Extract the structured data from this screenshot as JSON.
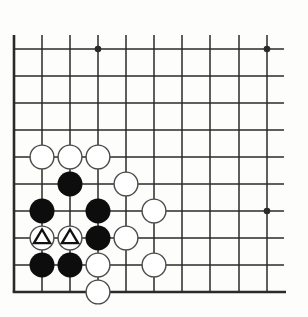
{
  "diagram": {
    "colors": {
      "background": "#fdfdfb",
      "line": "#2a2a2a",
      "black_stone": "#0d0d0d",
      "white_stone_fill": "#ffffff",
      "white_stone_stroke": "#4a4a4a"
    },
    "grid": {
      "columns": 10,
      "rows": 10,
      "x_positions": [
        14,
        42,
        70,
        98,
        126,
        154,
        182,
        210,
        239,
        267
      ],
      "y_positions": [
        49,
        76,
        103,
        130,
        157,
        184,
        211,
        238,
        265,
        292
      ],
      "top_extent": 35,
      "right_extent": 284,
      "edges": [
        "left",
        "bottom"
      ]
    },
    "star_points": [
      {
        "col": 3,
        "row": 0
      },
      {
        "col": 9,
        "row": 0
      },
      {
        "col": 9,
        "row": 6
      }
    ],
    "stones": [
      {
        "color": "white",
        "col": 1,
        "row": 4
      },
      {
        "color": "white",
        "col": 2,
        "row": 4
      },
      {
        "color": "white",
        "col": 3,
        "row": 4
      },
      {
        "color": "black",
        "col": 2,
        "row": 5
      },
      {
        "color": "white",
        "col": 4,
        "row": 5
      },
      {
        "color": "black",
        "col": 1,
        "row": 6
      },
      {
        "color": "black",
        "col": 3,
        "row": 6
      },
      {
        "color": "white",
        "col": 5,
        "row": 6
      },
      {
        "color": "white",
        "col": 1,
        "row": 7,
        "mark": "triangle"
      },
      {
        "color": "white",
        "col": 2,
        "row": 7,
        "mark": "triangle"
      },
      {
        "color": "black",
        "col": 3,
        "row": 7
      },
      {
        "color": "white",
        "col": 4,
        "row": 7
      },
      {
        "color": "black",
        "col": 1,
        "row": 8
      },
      {
        "color": "black",
        "col": 2,
        "row": 8
      },
      {
        "color": "white",
        "col": 3,
        "row": 8
      },
      {
        "color": "white",
        "col": 5,
        "row": 8
      },
      {
        "color": "white",
        "col": 3,
        "row": 9
      }
    ],
    "stone_radius": 12.5
  }
}
